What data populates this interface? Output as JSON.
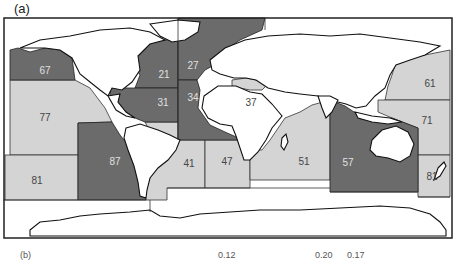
{
  "figure": {
    "panel_a_label": "(a)",
    "panel_b_label": "(b)",
    "colors": {
      "dark_area": "#6b6b6b",
      "light_area": "#d4d4d4",
      "land": "#ffffff",
      "border": "#1a1a1a",
      "dark_label": "#e0e0e0",
      "light_label": "#444444"
    },
    "bottom_cropped_values": [
      "0.12",
      "0.20",
      "0.17"
    ]
  },
  "map": {
    "title": "FAO major fishing areas",
    "areas": [
      {
        "id": "21",
        "shade": "dark",
        "label_x": 164,
        "label_y": 75
      },
      {
        "id": "27",
        "shade": "dark",
        "label_x": 193,
        "label_y": 66
      },
      {
        "id": "31",
        "shade": "dark",
        "label_x": 163,
        "label_y": 103
      },
      {
        "id": "34",
        "shade": "dark",
        "label_x": 193,
        "label_y": 98
      },
      {
        "id": "37",
        "shade": "light",
        "label_x": 251,
        "label_y": 103
      },
      {
        "id": "41",
        "shade": "light",
        "label_x": 189,
        "label_y": 164
      },
      {
        "id": "47",
        "shade": "light",
        "label_x": 227,
        "label_y": 162
      },
      {
        "id": "51",
        "shade": "light",
        "label_x": 304,
        "label_y": 162
      },
      {
        "id": "57",
        "shade": "dark",
        "label_x": 348,
        "label_y": 163
      },
      {
        "id": "61",
        "shade": "light",
        "label_x": 430,
        "label_y": 84
      },
      {
        "id": "67",
        "shade": "dark",
        "label_x": 45,
        "label_y": 71
      },
      {
        "id": "71",
        "shade": "light",
        "label_x": 427,
        "label_y": 121
      },
      {
        "id": "77",
        "shade": "light",
        "label_x": 45,
        "label_y": 118
      },
      {
        "id": "81",
        "shade": "light",
        "label_x": 37,
        "label_y": 181
      },
      {
        "id": "81b",
        "shade": "light",
        "label_x": 432,
        "label_y": 177,
        "text": "81"
      },
      {
        "id": "87",
        "shade": "dark",
        "label_x": 115,
        "label_y": 162
      }
    ]
  }
}
